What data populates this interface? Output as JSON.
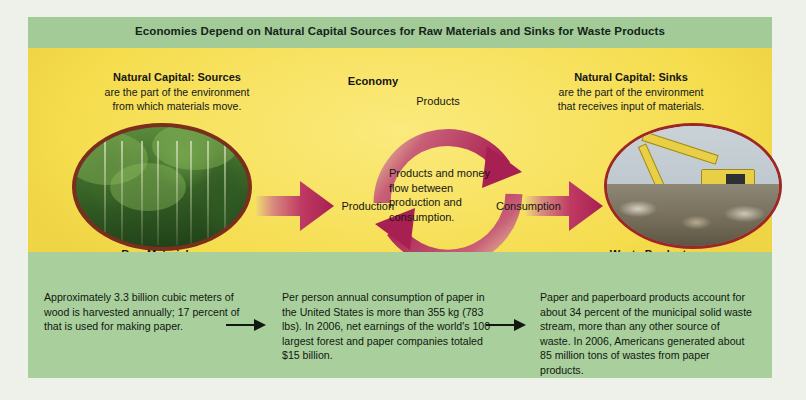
{
  "figure": {
    "title": "Economies Depend on Natural Capital Sources for Raw Materials and Sinks for Waste Products"
  },
  "sources": {
    "heading": "Natural Capital: Sources",
    "line2": "are the part of the environment",
    "line3": "from which materials move.",
    "photo_caption": "Raw Materials",
    "photo_alt": "forest-photo"
  },
  "sinks": {
    "heading": "Natural Capital: Sinks",
    "line2": "are the part of the environment",
    "line3": "that receives input of materials.",
    "photo_caption": "Waste Products",
    "photo_alt": "landfill-excavator-photo"
  },
  "economy": {
    "label": "Economy",
    "top_label": "Products",
    "bottom_label": "Money",
    "left_label": "Production",
    "right_label": "Consumption",
    "center_text": "Products and money flow between production and consumption."
  },
  "facts": [
    {
      "id": "wood-harvest",
      "text": "Approximately 3.3 billion cubic meters of wood is harvested annually; 17 percent of that is used for making paper."
    },
    {
      "id": "paper-consumption",
      "text": "Per person annual consumption of paper in the United States is more than 355 kg (783 lbs). In 2006, net earnings of the world's 100 largest forest and paper companies totaled $15 billion."
    },
    {
      "id": "paper-waste",
      "text": "Paper and paperboard products account for about 34 percent of the municipal solid waste stream, more than any other source of waste. In 2006, Americans generated about 85 million tons of wastes from paper products."
    }
  ],
  "colors": {
    "page_background": "#eef1ea",
    "header_green": "#a3cb98",
    "panel_yellow": "#f7e259",
    "panel_green": "#a9cf9d",
    "arrow_magenta": "#b5295c",
    "forest_border": "#7a2f1c",
    "landfill_border": "#9e2725",
    "text_dark": "#161616"
  },
  "icons": {
    "big_arrow": "right-arrow-icon",
    "small_arrow": "small-right-arrow-icon",
    "cycle_top": "curved-arrow-clockwise-icon",
    "cycle_bottom": "curved-arrow-counterclockwise-icon"
  }
}
